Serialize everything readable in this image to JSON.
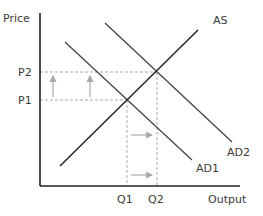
{
  "diagram": {
    "title": "",
    "axes": {
      "y_label": "Price",
      "x_label": "Output"
    },
    "price_levels": [
      {
        "label": "P1"
      },
      {
        "label": "P2"
      }
    ],
    "quantity_levels": [
      {
        "label": "Q1"
      },
      {
        "label": "Q2"
      }
    ],
    "curves": [
      {
        "label": "AS",
        "type": "aggregate-supply",
        "slope": "upward"
      },
      {
        "label": "AD1",
        "type": "aggregate-demand",
        "slope": "downward"
      },
      {
        "label": "AD2",
        "type": "aggregate-demand",
        "slope": "downward",
        "note": "shifted right"
      }
    ],
    "annotations": {
      "price_arrows": "upward from P1 to P2",
      "output_arrows": "rightward from Q1 to Q2"
    },
    "colors": {
      "axis": "#222222",
      "as_curve": "#2a2a2a",
      "ad_curve": "#444444",
      "guides": "#aaaaaa",
      "arrows": "#aaaaaa"
    }
  }
}
